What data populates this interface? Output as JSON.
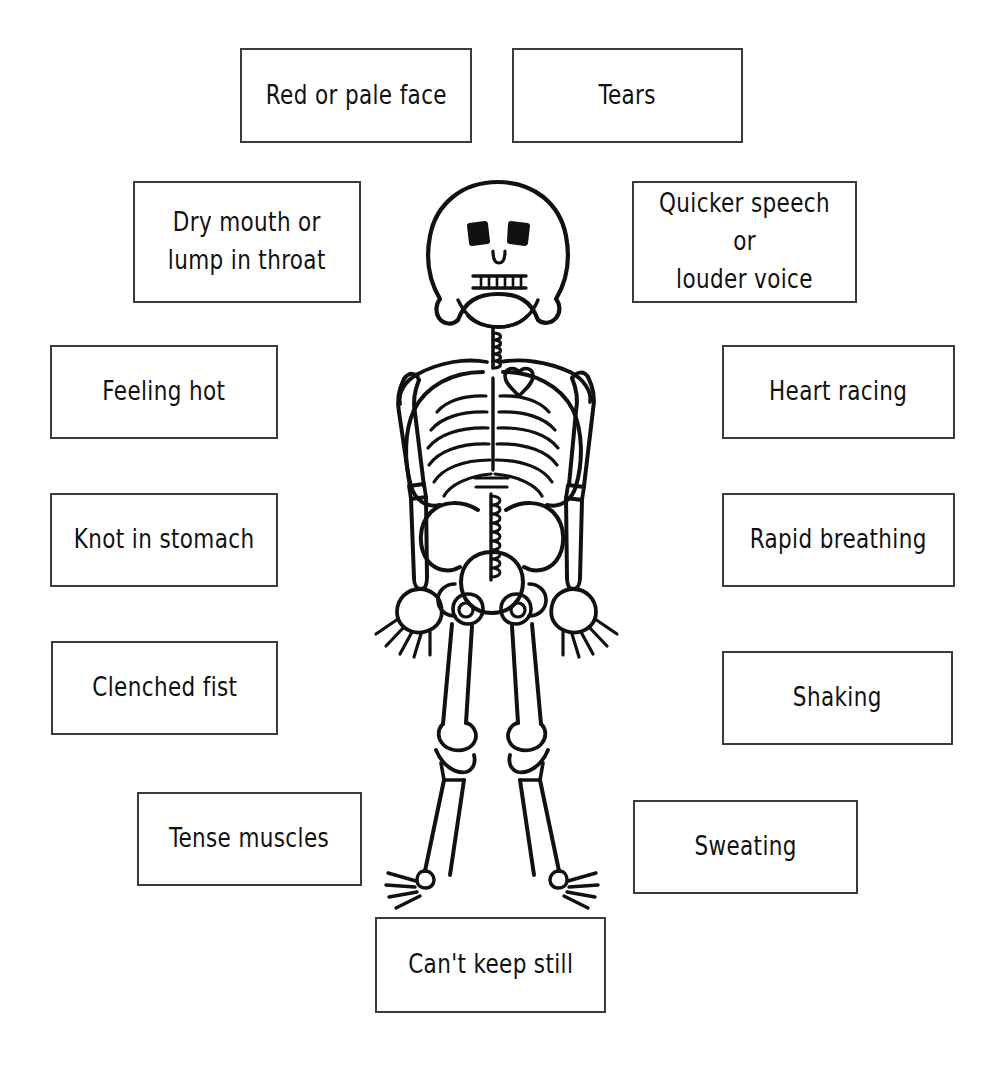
{
  "canvas": {
    "width": 996,
    "height": 1071,
    "background": "#ffffff",
    "ink_color": "#111111",
    "box_border_color": "#3b3b3b"
  },
  "figure": {
    "name": "skeleton"
  },
  "labels": [
    {
      "id": "red-or-pale-face",
      "text": "Red or pale face",
      "x": 240,
      "y": 48,
      "width": 232,
      "height": 95
    },
    {
      "id": "tears",
      "text": "Tears",
      "x": 512,
      "y": 48,
      "width": 231,
      "height": 95
    },
    {
      "id": "dry-mouth-or-lump-in-throat",
      "text": "Dry mouth or\nlump in throat",
      "x": 133,
      "y": 181,
      "width": 228,
      "height": 122
    },
    {
      "id": "quicker-speech-or-louder-voice",
      "text": "Quicker speech or\nlouder voice",
      "x": 632,
      "y": 181,
      "width": 225,
      "height": 122
    },
    {
      "id": "feeling-hot",
      "text": "Feeling hot",
      "x": 50,
      "y": 345,
      "width": 228,
      "height": 94
    },
    {
      "id": "heart-racing",
      "text": "Heart racing",
      "x": 722,
      "y": 345,
      "width": 233,
      "height": 94
    },
    {
      "id": "knot-in-stomach",
      "text": "Knot in stomach",
      "x": 50,
      "y": 493,
      "width": 228,
      "height": 94
    },
    {
      "id": "rapid-breathing",
      "text": "Rapid breathing",
      "x": 722,
      "y": 493,
      "width": 233,
      "height": 94
    },
    {
      "id": "clenched-fist",
      "text": "Clenched fist",
      "x": 51,
      "y": 641,
      "width": 227,
      "height": 94
    },
    {
      "id": "shaking",
      "text": "Shaking",
      "x": 722,
      "y": 651,
      "width": 231,
      "height": 94
    },
    {
      "id": "tense-muscles",
      "text": "Tense muscles",
      "x": 137,
      "y": 792,
      "width": 225,
      "height": 94
    },
    {
      "id": "sweating",
      "text": "Sweating",
      "x": 633,
      "y": 800,
      "width": 225,
      "height": 94
    },
    {
      "id": "cant-keep-still",
      "text": "Can't keep still",
      "x": 375,
      "y": 917,
      "width": 231,
      "height": 96
    }
  ]
}
